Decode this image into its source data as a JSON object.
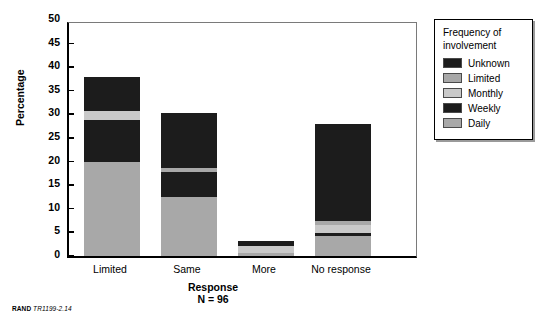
{
  "chart_data": {
    "type": "bar",
    "title": "",
    "xlabel": "Response",
    "ylabel": "Percentage",
    "ylim": [
      0,
      50
    ],
    "yticks": [
      0,
      5,
      10,
      15,
      20,
      25,
      30,
      35,
      40,
      45,
      50
    ],
    "grid": false,
    "stacked": true,
    "legend_title": "Frequency of involvement",
    "legend_position": "right-outside",
    "annotation": "N = 96",
    "footer": "RAND TR1199-2.14",
    "categories": [
      "Limited",
      "Same",
      "More",
      "No response"
    ],
    "series": [
      {
        "name": "Daily",
        "color": "#a8a8a8",
        "values": [
          20.0,
          12.5,
          0.6,
          4.2
        ]
      },
      {
        "name": "Weekly",
        "color": "#1c1c1c",
        "values": [
          8.8,
          5.2,
          0.0,
          0.6
        ]
      },
      {
        "name": "Monthly",
        "color": "#c9c9c9",
        "values": [
          1.9,
          0.0,
          1.6,
          1.7
        ]
      },
      {
        "name": "Limited",
        "color": "#a8a8a8",
        "values": [
          0.0,
          0.9,
          0.0,
          0.9
        ]
      },
      {
        "name": "Unknown",
        "color": "#1c1c1c",
        "values": [
          7.2,
          11.6,
          1.0,
          20.6
        ]
      }
    ],
    "totals": [
      37.9,
      30.2,
      3.2,
      28.0
    ]
  },
  "legend": {
    "title_line1": "Frequency of",
    "title_line2": "involvement",
    "entries": [
      {
        "label": "Unknown",
        "color": "#1c1c1c"
      },
      {
        "label": "Limited",
        "color": "#a8a8a8"
      },
      {
        "label": "Monthly",
        "color": "#c9c9c9"
      },
      {
        "label": "Weekly",
        "color": "#1c1c1c"
      },
      {
        "label": "Daily",
        "color": "#a8a8a8"
      }
    ]
  },
  "axes": {
    "y_title": "Percentage",
    "x_title": "Response",
    "n_note": "N = 96",
    "y_tick_labels": [
      "50",
      "45",
      "40",
      "35",
      "30",
      "25",
      "20",
      "15",
      "10",
      "5",
      "0"
    ],
    "x_tick_labels": [
      "Limited",
      "Same",
      "More",
      "No response"
    ]
  },
  "footer": {
    "source": "RAND",
    "code": "TR1199-2.14"
  },
  "corner": {
    "mark": ""
  }
}
